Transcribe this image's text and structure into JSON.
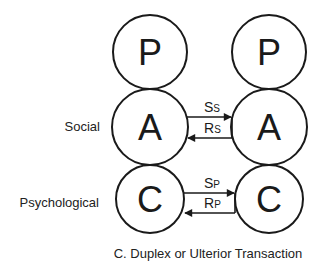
{
  "diagram": {
    "caption": "C. Duplex or Ulterior Transaction",
    "colors": {
      "stroke": "#1a1a1a",
      "text": "#222222",
      "background": "#ffffff"
    },
    "left_person": {
      "parent": "P",
      "adult": "A",
      "child": "C"
    },
    "right_person": {
      "parent": "P",
      "adult": "A",
      "child": "C"
    },
    "levels": {
      "social": "Social",
      "psychological": "Psychological"
    },
    "messages": {
      "social_stimulus": {
        "main": "S",
        "sub": "S",
        "direction": "left-to-right"
      },
      "social_response": {
        "main": "R",
        "sub": "S",
        "direction": "right-to-left"
      },
      "psych_stimulus": {
        "main": "S",
        "sub": "P",
        "direction": "left-to-right"
      },
      "psych_response": {
        "main": "R",
        "sub": "P",
        "direction": "right-to-left"
      }
    }
  }
}
